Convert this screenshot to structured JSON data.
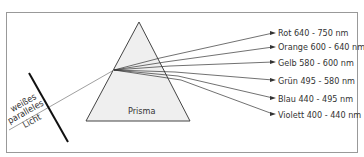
{
  "diagram": {
    "prism_label": "Prisma",
    "incoming_light_label": [
      "weißes",
      "paralleles",
      "Licht"
    ],
    "spectrum": [
      {
        "color": "Rot",
        "range": "640 - 750 nm",
        "label": "Rot  640 - 750 nm"
      },
      {
        "color": "Orange",
        "range": "600 - 640 nm",
        "label": "Orange  600 - 640 nm"
      },
      {
        "color": "Gelb",
        "range": "580 - 600 nm",
        "label": "Gelb 580 - 600 nm"
      },
      {
        "color": "Grün",
        "range": "495 - 580 nm",
        "label": "Grün  495 - 580 nm"
      },
      {
        "color": "Blau",
        "range": "440 - 495 nm",
        "label": "Blau  440 - 495 nm"
      },
      {
        "color": "Violett",
        "range": "400 - 440 nm",
        "label": "Violett  400 - 440 nm"
      }
    ]
  }
}
